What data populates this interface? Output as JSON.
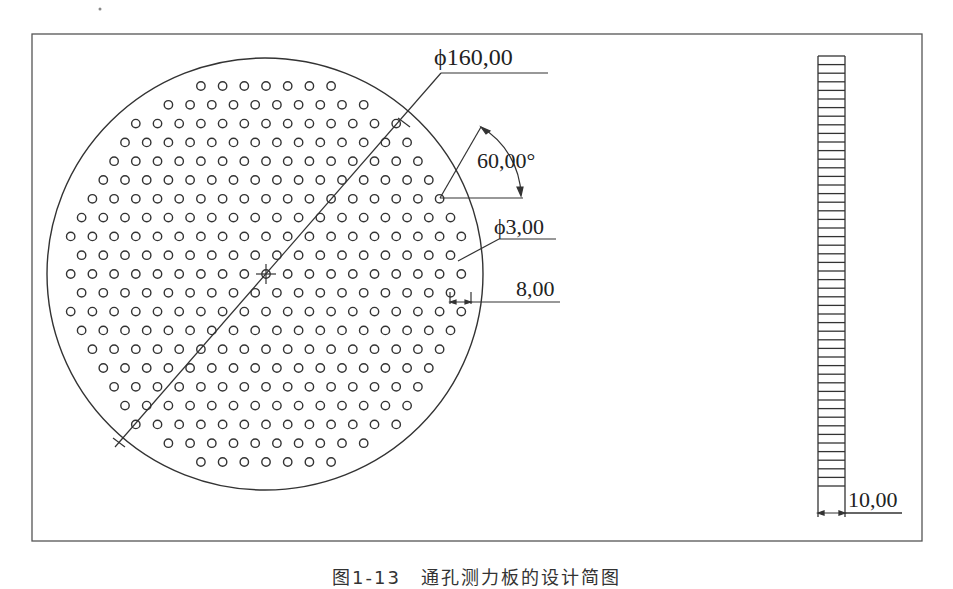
{
  "figure": {
    "caption": "图1-13　通孔测力板的设计简图",
    "colors": {
      "line": "#333333",
      "background": "#ffffff"
    }
  },
  "plate_top_view": {
    "diameter_label": "ϕ160,00",
    "angle_label": "60,00°",
    "hole_diameter_label": "ϕ3,00",
    "hole_pitch_label": "8,00",
    "hole_rows": [
      4,
      9,
      13,
      14,
      15,
      16,
      17,
      18,
      19,
      20,
      19,
      20,
      19,
      20,
      19,
      18,
      17,
      16,
      15,
      14,
      13,
      9,
      4
    ]
  },
  "plate_side_view": {
    "thickness_label": "10,00"
  }
}
